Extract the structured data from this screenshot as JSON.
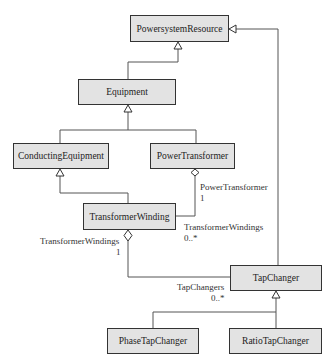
{
  "classes": {
    "powersystem_resource": "PowersystemResource",
    "equipment": "Equipment",
    "conducting_equipment": "ConductingEquipment",
    "power_transformer": "PowerTransformer",
    "transformer_winding": "TransformerWinding",
    "tap_changer": "TapChanger",
    "phase_tap_changer": "PhaseTapChanger",
    "ratio_tap_changer": "RatioTapChanger"
  },
  "associations": {
    "pt_role": "PowerTransformer",
    "pt_mult": "1",
    "tw_role_from_pt": "TransformerWindings",
    "tw_mult_from_pt": "0..*",
    "tw_role_to_tc": "TransformerWindings",
    "tw_mult_to_tc": "1",
    "tc_role": "TapChangers",
    "tc_mult": "0..*"
  },
  "colors": {
    "box_fill": "#e3e3e3",
    "box_border": "#333333",
    "line": "#555555"
  }
}
